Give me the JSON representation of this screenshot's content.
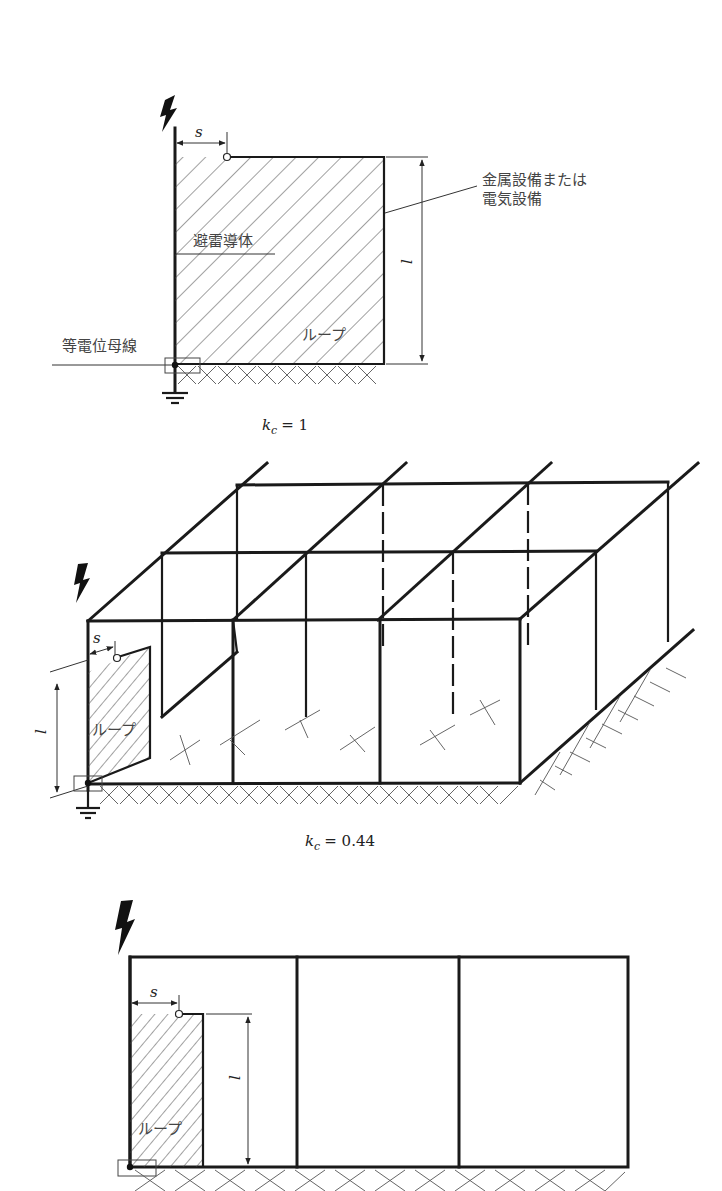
{
  "figure": {
    "panels": [
      {
        "id": "single-conductor",
        "labels": {
          "s": "s",
          "l": "l",
          "equipment": [
            "金属設備または",
            "電気設備"
          ],
          "down_conductor": "避雷導体",
          "loop": "ループ",
          "bonding_bar": "等電位母線"
        },
        "kc_symbol": "k",
        "kc_sub": "c",
        "kc_value": "= 1"
      },
      {
        "id": "mesh-3d",
        "labels": {
          "s": "s",
          "l": "l",
          "loop": "ループ"
        },
        "kc_symbol": "k",
        "kc_sub": "c",
        "kc_value": "= 0.44"
      },
      {
        "id": "three-bay-frame",
        "labels": {
          "s": "s",
          "l": "l",
          "loop": "ループ"
        }
      }
    ]
  }
}
